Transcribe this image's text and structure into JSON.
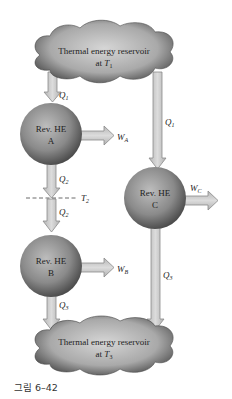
{
  "figure": {
    "caption": "그림 6–42",
    "top_reservoir": {
      "line1": "Thermal energy reservoir",
      "line2_prefix": "at ",
      "temp_symbol": "T",
      "temp_sub": "1"
    },
    "bottom_reservoir": {
      "line1": "Thermal energy reservoir",
      "line2_prefix": "at ",
      "temp_symbol": "T",
      "temp_sub": "3"
    },
    "engines": [
      {
        "id": "A",
        "line1": "Rev. HE",
        "line2": "A",
        "work_symbol": "W",
        "work_sub": "A"
      },
      {
        "id": "B",
        "line1": "Rev. HE",
        "line2": "B",
        "work_symbol": "W",
        "work_sub": "B"
      },
      {
        "id": "C",
        "line1": "Rev. HE",
        "line2": "C",
        "work_symbol": "W",
        "work_sub": "C"
      }
    ],
    "heat_flows": [
      {
        "symbol": "Q",
        "sub": "1",
        "from": "reservoir T1",
        "to": "Rev. HE A"
      },
      {
        "symbol": "Q",
        "sub": "2",
        "from": "Rev. HE A",
        "to": "T2 level"
      },
      {
        "symbol": "Q",
        "sub": "2",
        "from": "T2 level",
        "to": "Rev. HE B"
      },
      {
        "symbol": "Q",
        "sub": "3",
        "from": "Rev. HE B",
        "to": "reservoir T3"
      },
      {
        "symbol": "Q",
        "sub": "1",
        "from": "reservoir T1",
        "to": "Rev. HE C"
      },
      {
        "symbol": "Q",
        "sub": "3",
        "from": "Rev. HE C",
        "to": "reservoir T3"
      }
    ],
    "intermediate_level": {
      "symbol": "T",
      "sub": "2"
    },
    "colors": {
      "arrow_fill": "#c8c8c8",
      "arrow_stroke": "#8a8a8a",
      "sphere_light": "#b8b8b8",
      "sphere_dark": "#4a4a4a",
      "cloud_light": "#d0d0d0",
      "cloud_dark": "#555555"
    }
  }
}
